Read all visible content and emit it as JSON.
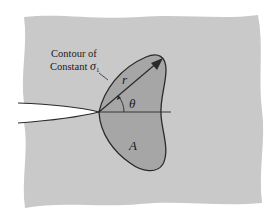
{
  "figure": {
    "colors": {
      "plate": "#c9c9c9",
      "contour_fill": "#a6a6a6",
      "outline": "#2a2a2a",
      "crack": "#ffffff",
      "background": "#ffffff"
    },
    "labels": {
      "contour_line1": "Contour of",
      "contour_line2_text": "Constant ",
      "contour_line2_symbol": "σ",
      "contour_line2_subscript": "1",
      "radius": "r",
      "angle": "θ",
      "area": "A"
    }
  }
}
